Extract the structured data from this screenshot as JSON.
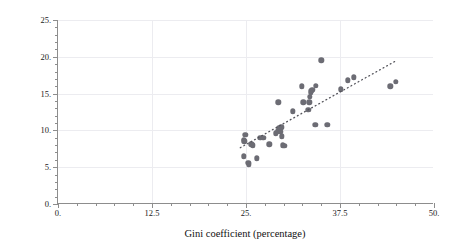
{
  "chart_data": {
    "type": "scatter",
    "title": "",
    "xlabel": "Gini coefficient (percentage)",
    "ylabel": "Relative income poverty (percentage)",
    "xlim": [
      0,
      50
    ],
    "ylim": [
      0,
      25
    ],
    "xticks": [
      0,
      12.5,
      25,
      37.5,
      50
    ],
    "xticklabels": [
      "0.",
      "12.5",
      "25.",
      "37.5",
      "50."
    ],
    "yticks": [
      0,
      5,
      10,
      15,
      20,
      25
    ],
    "yticklabels": [
      "0.",
      "5.",
      "10.",
      "15.",
      "20.",
      "25."
    ],
    "grid": true,
    "legend": null,
    "marker_color": "#6c6c74",
    "trendline": {
      "style": "dotted",
      "color": "#53535a",
      "x": [
        24.3,
        45.0
      ],
      "y": [
        7.6,
        19.4
      ]
    },
    "points": [
      {
        "x": 24.7,
        "y": 8.7
      },
      {
        "x": 24.8,
        "y": 8.5
      },
      {
        "x": 24.9,
        "y": 9.4
      },
      {
        "x": 24.7,
        "y": 6.5
      },
      {
        "x": 25.3,
        "y": 5.6
      },
      {
        "x": 25.4,
        "y": 5.4
      },
      {
        "x": 25.7,
        "y": 8.1
      },
      {
        "x": 25.9,
        "y": 8.0
      },
      {
        "x": 26.4,
        "y": 6.2
      },
      {
        "x": 26.9,
        "y": 9.0
      },
      {
        "x": 27.3,
        "y": 9.0
      },
      {
        "x": 28.1,
        "y": 8.1
      },
      {
        "x": 29.0,
        "y": 9.6
      },
      {
        "x": 29.2,
        "y": 9.9
      },
      {
        "x": 29.4,
        "y": 10.3
      },
      {
        "x": 29.5,
        "y": 10.0
      },
      {
        "x": 29.6,
        "y": 9.8
      },
      {
        "x": 29.7,
        "y": 10.4
      },
      {
        "x": 29.8,
        "y": 9.2
      },
      {
        "x": 29.9,
        "y": 8.0
      },
      {
        "x": 30.1,
        "y": 7.9
      },
      {
        "x": 29.3,
        "y": 13.8
      },
      {
        "x": 31.2,
        "y": 12.6
      },
      {
        "x": 32.4,
        "y": 16.0
      },
      {
        "x": 32.6,
        "y": 13.8
      },
      {
        "x": 33.5,
        "y": 14.6
      },
      {
        "x": 33.6,
        "y": 15.1
      },
      {
        "x": 33.7,
        "y": 15.4
      },
      {
        "x": 33.8,
        "y": 15.5
      },
      {
        "x": 33.4,
        "y": 13.8
      },
      {
        "x": 33.3,
        "y": 12.8
      },
      {
        "x": 34.3,
        "y": 16.1
      },
      {
        "x": 35.0,
        "y": 19.5
      },
      {
        "x": 34.2,
        "y": 10.8
      },
      {
        "x": 35.8,
        "y": 10.8
      },
      {
        "x": 37.6,
        "y": 15.6
      },
      {
        "x": 38.5,
        "y": 16.8
      },
      {
        "x": 39.3,
        "y": 17.2
      },
      {
        "x": 44.2,
        "y": 16.0
      },
      {
        "x": 44.9,
        "y": 16.6
      }
    ]
  }
}
